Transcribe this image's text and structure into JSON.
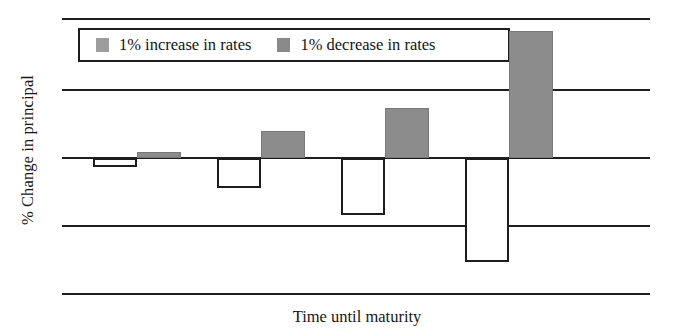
{
  "chart_data": {
    "type": "bar",
    "title": "",
    "subtitle": "",
    "xlabel": "Time until maturity",
    "ylabel": "% Change in principal",
    "categories": [
      "1",
      "2",
      "3",
      "4"
    ],
    "series": [
      {
        "name": "1% increase in rates",
        "color": "#ffffff",
        "edge_color": "#1d1d1d",
        "values": [
          -0.13,
          -0.44,
          -0.84,
          -1.53
        ]
      },
      {
        "name": "1% decrease in rates",
        "color": "#8c8c8c",
        "edge_color": "#787878",
        "values": [
          0.09,
          0.4,
          0.74,
          1.88
        ]
      }
    ],
    "ylim": [
      -2.0,
      2.05
    ],
    "yticks": [
      2.05,
      1.0,
      0.0,
      -1.0,
      -2.0
    ],
    "ytick_labels": [
      "",
      "",
      "",
      "",
      ""
    ],
    "xtick_labels": [
      "",
      "",
      "",
      ""
    ],
    "grid": true,
    "grid_orientation": "horizontal",
    "legend_position": "upper-left",
    "baseline": 0
  },
  "legend": {
    "entries": [
      {
        "label": "1% increase in rates",
        "swatch_color": "#9d9d9d"
      },
      {
        "label": "1% decrease in rates",
        "swatch_color": "#8a8a8a"
      }
    ]
  },
  "axes": {
    "x_title": "Time until maturity",
    "y_title": "% Change in principal"
  }
}
